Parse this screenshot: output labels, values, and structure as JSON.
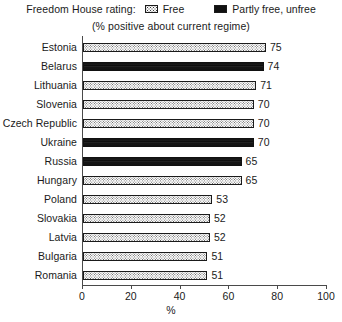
{
  "legend": {
    "title": "Freedom House rating:",
    "entries": [
      {
        "label": "Free",
        "swatch": "free-pattern-swatch",
        "color": "#fbfbfb"
      },
      {
        "label": "Partly free, unfree",
        "swatch": "unfree-solid-swatch",
        "color": "#111111"
      }
    ]
  },
  "subtitle": "(% positive about current regime)",
  "chart_data": {
    "type": "bar",
    "orientation": "horizontal",
    "title": "",
    "subtitle": "(% positive about current regime)",
    "xlabel": "%",
    "ylabel": "",
    "xlim": [
      0,
      100
    ],
    "xticks": [
      0,
      20,
      40,
      60,
      80,
      100
    ],
    "grid": false,
    "legend_position": "top-center",
    "categories": [
      "Estonia",
      "Belarus",
      "Lithuania",
      "Slovenia",
      "Czech Republic",
      "Ukraine",
      "Russia",
      "Hungary",
      "Poland",
      "Slovakia",
      "Latvia",
      "Bulgaria",
      "Romania"
    ],
    "values": [
      75,
      74,
      71,
      70,
      70,
      70,
      65,
      65,
      53,
      52,
      52,
      51,
      51
    ],
    "groups": [
      "Free",
      "Partly free, unfree",
      "Free",
      "Free",
      "Free",
      "Partly free, unfree",
      "Partly free, unfree",
      "Free",
      "Free",
      "Free",
      "Free",
      "Free",
      "Free"
    ],
    "bars": [
      {
        "category": "Estonia",
        "value": 75,
        "label": "75",
        "group": "Free"
      },
      {
        "category": "Belarus",
        "value": 74,
        "label": "74",
        "group": "Partly free, unfree"
      },
      {
        "category": "Lithuania",
        "value": 71,
        "label": "71",
        "group": "Free"
      },
      {
        "category": "Slovenia",
        "value": 70,
        "label": "70",
        "group": "Free"
      },
      {
        "category": "Czech Republic",
        "value": 70,
        "label": "70",
        "group": "Free"
      },
      {
        "category": "Ukraine",
        "value": 70,
        "label": "70",
        "group": "Partly free, unfree"
      },
      {
        "category": "Russia",
        "value": 65,
        "label": "65",
        "group": "Partly free, unfree"
      },
      {
        "category": "Hungary",
        "value": 65,
        "label": "65",
        "group": "Free"
      },
      {
        "category": "Poland",
        "value": 53,
        "label": "53",
        "group": "Free"
      },
      {
        "category": "Slovakia",
        "value": 52,
        "label": "52",
        "group": "Free"
      },
      {
        "category": "Latvia",
        "value": 52,
        "label": "52",
        "group": "Free"
      },
      {
        "category": "Bulgaria",
        "value": 51,
        "label": "51",
        "group": "Free"
      },
      {
        "category": "Romania",
        "value": 51,
        "label": "51",
        "group": "Free"
      }
    ],
    "xtick_labels": [
      "0",
      "20",
      "40",
      "60",
      "80",
      "100"
    ]
  }
}
